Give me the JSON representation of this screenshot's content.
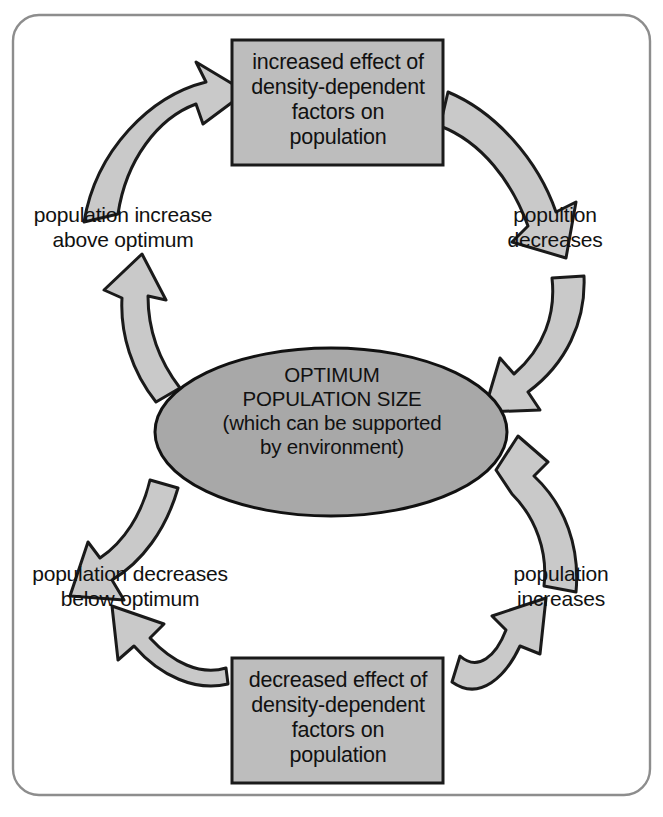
{
  "diagram": {
    "type": "cycle-feedback-diagram",
    "direction": "clockwise",
    "frame": {
      "shape": "rounded-rectangle",
      "stroke_color": "#8d8d8d",
      "fill_color": "#ffffff"
    },
    "colors": {
      "box_fill": "#bdbdbd",
      "box_stroke": "#1a1a1a",
      "ellipse_fill": "#a8a8a8",
      "ellipse_stroke": "#111111",
      "arrow_fill": "#c9c9c9",
      "arrow_stroke": "#1a1a1a",
      "text_color": "#111111",
      "frame_stroke": "#8d8d8d"
    },
    "center": {
      "shape": "ellipse",
      "label": "OPTIMUM\nPOPULATION SIZE\n(which can be supported\nby environment)",
      "lines": [
        "OPTIMUM",
        "POPULATION SIZE",
        "(which can be supported",
        "by environment)"
      ]
    },
    "boxes": [
      {
        "id": "box-top",
        "position": "top",
        "label": "increased effect of\ndensity-dependent\nfactors on\npopulation",
        "lines": [
          "increased effect of",
          "density-dependent",
          "factors on",
          "population"
        ]
      },
      {
        "id": "box-bottom",
        "position": "bottom",
        "label": "decreased effect of\ndensity-dependent\nfactors on\npopulation",
        "lines": [
          "decreased effect of",
          "density-dependent",
          "factors on",
          "population"
        ]
      }
    ],
    "labels": [
      {
        "id": "label-top-left",
        "position": "upper-left",
        "label": "population increase\nabove optimum",
        "lines": [
          "population increase",
          "above optimum"
        ]
      },
      {
        "id": "label-top-right",
        "position": "upper-right",
        "label": "popultion\ndecreases",
        "lines": [
          "popultion",
          "decreases"
        ]
      },
      {
        "id": "label-bottom-left",
        "position": "lower-left",
        "label": "population decreases\nbelow optimum",
        "lines": [
          "population decreases",
          "below optimum"
        ]
      },
      {
        "id": "label-bottom-right",
        "position": "lower-right",
        "label": "population\nincreases",
        "lines": [
          "population",
          "increases"
        ]
      }
    ],
    "arrows": [
      {
        "id": "arrow-1",
        "from": "label-top-left",
        "to": "box-top",
        "direction": "up-right"
      },
      {
        "id": "arrow-2",
        "from": "box-top",
        "to": "label-top-right",
        "direction": "down-right"
      },
      {
        "id": "arrow-3",
        "from": "label-top-right",
        "to": "center",
        "direction": "down-left"
      },
      {
        "id": "arrow-4",
        "from": "center",
        "to": "label-bottom-right",
        "direction": "down"
      },
      {
        "id": "arrow-5",
        "from": "label-bottom-right",
        "to": "box-bottom",
        "direction": "up-left"
      },
      {
        "id": "arrow-6",
        "from": "box-bottom",
        "to": "label-bottom-left",
        "direction": "up-left"
      },
      {
        "id": "arrow-7",
        "from": "label-bottom-left",
        "to": "center",
        "direction": "up-right"
      },
      {
        "id": "arrow-8",
        "from": "center",
        "to": "label-top-left",
        "direction": "up-left"
      }
    ]
  }
}
